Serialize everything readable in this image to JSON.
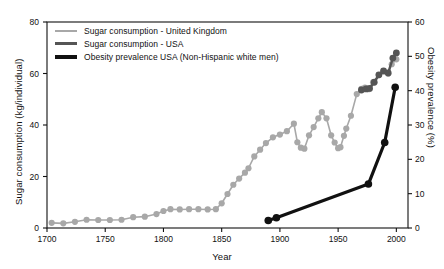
{
  "chart_data": {
    "type": "line",
    "title": "",
    "xlabel": "Year",
    "ylabel": "Sugar consumption (kg/individual)",
    "ylabel_right": "Obesity prevalence (%)",
    "xlim": [
      1700,
      2010
    ],
    "ylim": [
      0,
      80
    ],
    "ylim_right": [
      0,
      60
    ],
    "xticks": [
      1700,
      1750,
      1800,
      1850,
      1900,
      1950,
      2000
    ],
    "yticks": [
      0,
      20,
      40,
      60,
      80
    ],
    "yticks_right": [
      0,
      10,
      20,
      30,
      40,
      50,
      60
    ],
    "grid": false,
    "legend_position": "top-left",
    "series": [
      {
        "name": "Sugar consumption - United Kingdom",
        "axis": "left",
        "color": "#a8a8a8",
        "marker": "circle",
        "points": [
          [
            1704,
            2.0
          ],
          [
            1714,
            1.8
          ],
          [
            1724,
            2.4
          ],
          [
            1734,
            3.2
          ],
          [
            1744,
            3.1
          ],
          [
            1754,
            3.1
          ],
          [
            1764,
            3.2
          ],
          [
            1774,
            4.2
          ],
          [
            1784,
            4.4
          ],
          [
            1794,
            5.4
          ],
          [
            1800,
            6.6
          ],
          [
            1806,
            7.3
          ],
          [
            1814,
            7.2
          ],
          [
            1822,
            7.3
          ],
          [
            1830,
            7.3
          ],
          [
            1838,
            7.2
          ],
          [
            1845,
            7.3
          ],
          [
            1850,
            9.6
          ],
          [
            1855,
            13.2
          ],
          [
            1860,
            16.8
          ],
          [
            1865,
            19.2
          ],
          [
            1870,
            21.5
          ],
          [
            1873,
            23.2
          ],
          [
            1878,
            27.8
          ],
          [
            1883,
            30.4
          ],
          [
            1888,
            33.0
          ],
          [
            1894,
            35.2
          ],
          [
            1900,
            36.3
          ],
          [
            1906,
            37.6
          ],
          [
            1912,
            40.5
          ],
          [
            1915,
            33.3
          ],
          [
            1918,
            31.2
          ],
          [
            1921,
            30.8
          ],
          [
            1925,
            36.0
          ],
          [
            1929,
            39.2
          ],
          [
            1933,
            42.6
          ],
          [
            1936,
            45.0
          ],
          [
            1940,
            42.6
          ],
          [
            1944,
            36.0
          ],
          [
            1947,
            33.2
          ],
          [
            1950,
            31.0
          ],
          [
            1952,
            31.4
          ],
          [
            1955,
            35.8
          ],
          [
            1957,
            38.6
          ],
          [
            1961,
            43.6
          ],
          [
            1966,
            52.0
          ],
          [
            1970,
            54.0
          ],
          [
            1973,
            54.5
          ],
          [
            1976,
            53.9
          ],
          [
            1980,
            56.6
          ],
          [
            1985,
            59.4
          ],
          [
            1989,
            60.8
          ],
          [
            1993,
            60.0
          ],
          [
            1996,
            63.6
          ],
          [
            2000,
            65.5
          ]
        ]
      },
      {
        "name": "Sugar consumption - USA",
        "axis": "left",
        "color": "#555555",
        "marker": "circle",
        "points": [
          [
            1970,
            53.6
          ],
          [
            1974,
            54.0
          ],
          [
            1977,
            54.2
          ],
          [
            1981,
            56.6
          ],
          [
            1985,
            59.5
          ],
          [
            1989,
            61.0
          ],
          [
            1993,
            60.2
          ],
          [
            1997,
            66.0
          ],
          [
            2000,
            68.0
          ]
        ]
      },
      {
        "name": "Obesity prevalence USA  (Non-Hispanic white men)",
        "axis": "right",
        "color": "#111111",
        "marker": "circle",
        "points": [
          [
            1890,
            2.2
          ],
          [
            1897,
            3.0
          ],
          [
            1976,
            12.8
          ],
          [
            1990,
            24.9
          ],
          [
            1999,
            41.0
          ]
        ]
      }
    ],
    "legend": [
      {
        "label": "Sugar consumption - United Kingdom",
        "color": "#a8a8a8",
        "thickness": 2
      },
      {
        "label": "Sugar consumption - USA",
        "color": "#555555",
        "thickness": 3
      },
      {
        "label": "Obesity prevalence USA  (Non-Hispanic white men)",
        "color": "#111111",
        "thickness": 4
      }
    ]
  }
}
